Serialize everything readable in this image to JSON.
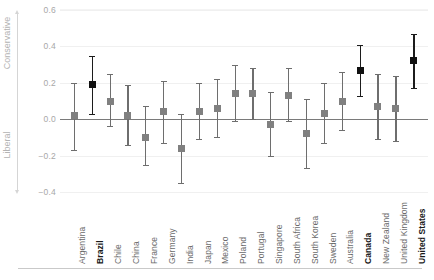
{
  "chart_data": {
    "type": "scatter",
    "title": "",
    "subtitle": "",
    "xlabel": "",
    "ylabel": "",
    "ylim": [
      -0.4,
      0.6
    ],
    "yticks": [
      0.6,
      0.4,
      0.2,
      0.0,
      -0.2,
      -0.4
    ],
    "ytick_labels": [
      "0.6",
      "0.4",
      "0.2",
      "0.0",
      "−0.2",
      "−0.4"
    ],
    "grid": true,
    "legend": "none",
    "axis_pole_top": "Conservative",
    "axis_pole_bottom": "Liberal",
    "zero_reference_line": 0.0,
    "marker_colors": {
      "default": "#808080",
      "highlight": "#111111"
    },
    "categories": [
      "Argentina",
      "Brazil",
      "Chile",
      "China",
      "France",
      "Germany",
      "India",
      "Japan",
      "Mexico",
      "Poland",
      "Portugal",
      "Singapore",
      "South Africa",
      "South Korea",
      "Sweden",
      "Australia",
      "Canada",
      "New Zealand",
      "United Kingdom",
      "United States"
    ],
    "highlighted": [
      "Brazil",
      "Canada",
      "United States"
    ],
    "values": [
      0.02,
      0.19,
      0.1,
      0.02,
      -0.1,
      0.04,
      -0.16,
      0.04,
      0.06,
      0.14,
      0.14,
      -0.03,
      0.13,
      -0.08,
      0.03,
      0.1,
      0.27,
      0.07,
      0.06,
      0.32
    ],
    "ci_low": [
      -0.17,
      0.03,
      -0.04,
      -0.14,
      -0.25,
      -0.13,
      -0.35,
      -0.11,
      -0.1,
      -0.01,
      0.0,
      -0.2,
      -0.01,
      -0.27,
      -0.13,
      -0.06,
      0.13,
      -0.11,
      -0.12,
      0.17
    ],
    "ci_high": [
      0.2,
      0.35,
      0.25,
      0.19,
      0.07,
      0.21,
      0.03,
      0.2,
      0.22,
      0.3,
      0.28,
      0.15,
      0.28,
      0.11,
      0.2,
      0.26,
      0.41,
      0.25,
      0.24,
      0.47
    ]
  }
}
